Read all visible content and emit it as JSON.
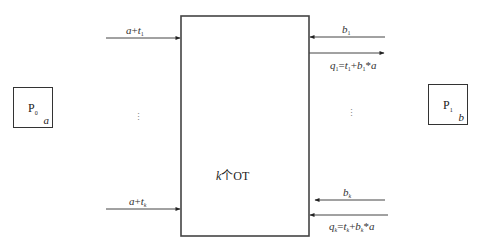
{
  "diagram": {
    "type": "oblivious-transfer-protocol",
    "parties": [
      {
        "id": "P0",
        "name": "P",
        "sub": "0",
        "secret": "a"
      },
      {
        "id": "P1",
        "name": "P",
        "sub": "1",
        "secret": "b"
      }
    ],
    "center_box": {
      "label_var": "k",
      "label_text": "个OT"
    },
    "left_inputs": [
      {
        "var": "a",
        "op": "+",
        "term": "t",
        "sub": "1",
        "direction": "into-box"
      },
      {
        "var": "a",
        "op": "+",
        "term": "t",
        "sub": "k",
        "direction": "into-box"
      }
    ],
    "right_inputs": [
      {
        "label": "b",
        "sub": "1",
        "direction": "into-box"
      },
      {
        "label": "b",
        "sub": "k",
        "direction": "into-box"
      }
    ],
    "right_outputs": [
      {
        "q": "q",
        "q_sub": "1",
        "t": "t",
        "t_sub": "1",
        "b": "b",
        "b_sub": "1",
        "a": "a",
        "direction": "out-of-box"
      },
      {
        "q": "q",
        "q_sub": "k",
        "t": "t",
        "t_sub": "k",
        "b": "b",
        "b_sub": "k",
        "a": "a",
        "direction": "into-box"
      }
    ],
    "ellipsis": "⋮",
    "symbols": {
      "plus": "+",
      "equals": "=",
      "times": "*"
    },
    "colors": {
      "stroke": "#333333",
      "text": "#333333",
      "background": "#ffffff"
    }
  }
}
